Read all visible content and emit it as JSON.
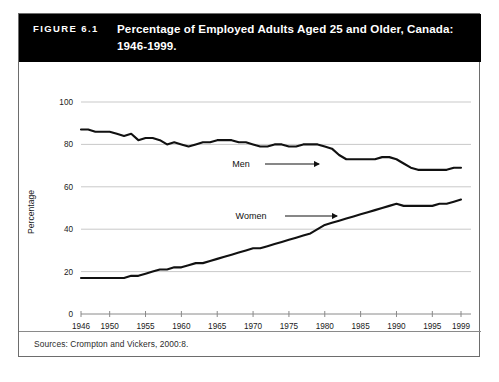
{
  "figure": {
    "number": "FIGURE 6.1",
    "title": "Percentage of Employed Adults Aged 25 and Older, Canada: 1946-1999.",
    "source": "Sources: Crompton and Vickers, 2000:8."
  },
  "annotations": {
    "men_label": "Men",
    "women_label": "Women"
  },
  "colors": {
    "title_bar_bg": "#000000",
    "title_bar_text": "#ffffff",
    "line": "#111111",
    "grid": "#c9c9c9",
    "axis": "#8a8a8a",
    "frame": "#6d6d6d"
  },
  "chart_data": {
    "type": "line",
    "title": "Percentage of Employed Adults Aged 25 and Older, Canada: 1946-1999.",
    "xlabel": "",
    "ylabel": "Percentage",
    "xlim": [
      1946,
      1999
    ],
    "ylim": [
      0,
      100
    ],
    "yticks": [
      0,
      20,
      40,
      60,
      80,
      100
    ],
    "xticks": [
      1946,
      1950,
      1955,
      1960,
      1965,
      1970,
      1975,
      1980,
      1985,
      1990,
      1995,
      1999
    ],
    "grid": true,
    "legend": "inline-annotations",
    "x": [
      1946,
      1947,
      1948,
      1949,
      1950,
      1951,
      1952,
      1953,
      1954,
      1955,
      1956,
      1957,
      1958,
      1959,
      1960,
      1961,
      1962,
      1963,
      1964,
      1965,
      1966,
      1967,
      1968,
      1969,
      1970,
      1971,
      1972,
      1973,
      1974,
      1975,
      1976,
      1977,
      1978,
      1979,
      1980,
      1981,
      1982,
      1983,
      1984,
      1985,
      1986,
      1987,
      1988,
      1989,
      1990,
      1991,
      1992,
      1993,
      1994,
      1995,
      1996,
      1997,
      1998,
      1999
    ],
    "series": [
      {
        "name": "Men",
        "values": [
          87,
          87,
          86,
          86,
          86,
          85,
          84,
          85,
          82,
          83,
          83,
          82,
          80,
          81,
          80,
          79,
          80,
          81,
          81,
          82,
          82,
          82,
          81,
          81,
          80,
          79,
          79,
          80,
          80,
          79,
          79,
          80,
          80,
          80,
          79,
          78,
          75,
          73,
          73,
          73,
          73,
          73,
          74,
          74,
          73,
          71,
          69,
          68,
          68,
          68,
          68,
          68,
          69,
          69
        ]
      },
      {
        "name": "Women",
        "values": [
          17,
          17,
          17,
          17,
          17,
          17,
          17,
          18,
          18,
          19,
          20,
          21,
          21,
          22,
          22,
          23,
          24,
          24,
          25,
          26,
          27,
          28,
          29,
          30,
          31,
          31,
          32,
          33,
          34,
          35,
          36,
          37,
          38,
          40,
          42,
          43,
          44,
          45,
          46,
          47,
          48,
          49,
          50,
          51,
          52,
          51,
          51,
          51,
          51,
          51,
          52,
          52,
          53,
          54
        ]
      }
    ]
  }
}
